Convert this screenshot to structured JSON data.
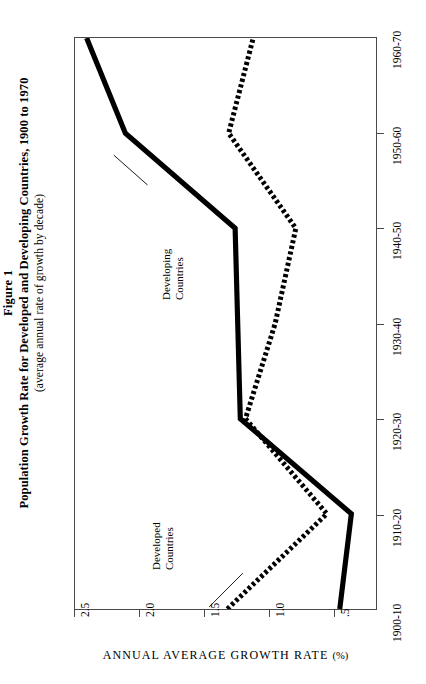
{
  "figure": {
    "label": "Figure 1",
    "title": "Population Growth Rate for Developed and Developing Countries, 1900 to 1970",
    "subtitle": "(average annual rate of growth by decade)"
  },
  "axes": {
    "value_axis_title": "ANNUAL AVERAGE GROWTH RATE",
    "value_axis_unit": "(%)",
    "value_ticks": [
      "2.5",
      "2.0",
      "1.5",
      "1.0",
      ".5"
    ],
    "value_tick_values": [
      2.5,
      2.0,
      1.5,
      1.0,
      0.5
    ],
    "decade_ticks": [
      "1960-70",
      "1950-60",
      "1940-50",
      "1930-40",
      "1920-30",
      "1910-20",
      "1900-10"
    ]
  },
  "annotations": {
    "developing": {
      "line1": "Developing",
      "line2": "Countries"
    },
    "developed": {
      "line1": "Developed",
      "line2": "Countries"
    }
  },
  "colors": {
    "ink": "#000000",
    "frame": "#4a4a4a",
    "background": "#ffffff"
  },
  "chart_data": {
    "type": "line",
    "title": "Population Growth Rate for Developed and Developing Countries, 1900 to 1970",
    "subtitle": "(average annual rate of growth by decade)",
    "orientation": "horizontal",
    "categories": [
      "1900-10",
      "1910-20",
      "1920-30",
      "1930-40",
      "1940-50",
      "1950-60",
      "1960-70"
    ],
    "xlabel": "ANNUAL AVERAGE GROWTH RATE (%)",
    "ylabel": "",
    "xlim": [
      0.0,
      2.5
    ],
    "grid": false,
    "legend": "inline-annotations",
    "series": [
      {
        "name": "Developing Countries",
        "style": "solid-thick",
        "values": [
          0.45,
          0.36,
          1.22,
          1.24,
          1.26,
          2.11,
          2.41
        ]
      },
      {
        "name": "Developed Countries",
        "style": "dotted-thick",
        "values": [
          1.32,
          0.55,
          1.18,
          0.95,
          0.79,
          1.31,
          1.12
        ]
      }
    ]
  }
}
